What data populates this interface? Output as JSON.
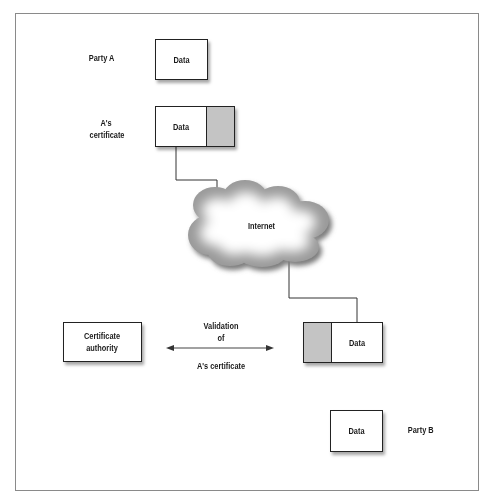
{
  "diagram": {
    "party_a": {
      "label": "Party A",
      "data_box": "Data"
    },
    "a_certificate": {
      "label_line1": "A's",
      "label_line2": "certificate",
      "data_box": "Data"
    },
    "network": {
      "label": "Internet"
    },
    "certificate_authority": {
      "label_line1": "Certificate",
      "label_line2": "authority"
    },
    "validation": {
      "line1": "Validation",
      "line2": "of",
      "line3": "A's certificate"
    },
    "received_certificate": {
      "data_box": "Data"
    },
    "party_b": {
      "label": "Party B",
      "data_box": "Data"
    },
    "colors": {
      "signature_fill": "#c4c4c4",
      "border": "#222222",
      "frame": "#8a8a8a"
    }
  }
}
